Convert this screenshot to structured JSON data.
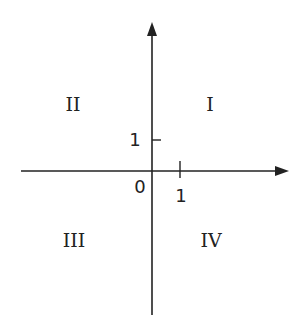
{
  "diagram": {
    "quadrants": [
      {
        "id": "I",
        "label": "I"
      },
      {
        "id": "II",
        "label": "II"
      },
      {
        "id": "III",
        "label": "III"
      },
      {
        "id": "IV",
        "label": "IV"
      }
    ],
    "origin_label": "0",
    "x_tick_label": "1",
    "y_tick_label": "1",
    "colors": {
      "axis": "#222222",
      "background": "#ffffff"
    }
  }
}
